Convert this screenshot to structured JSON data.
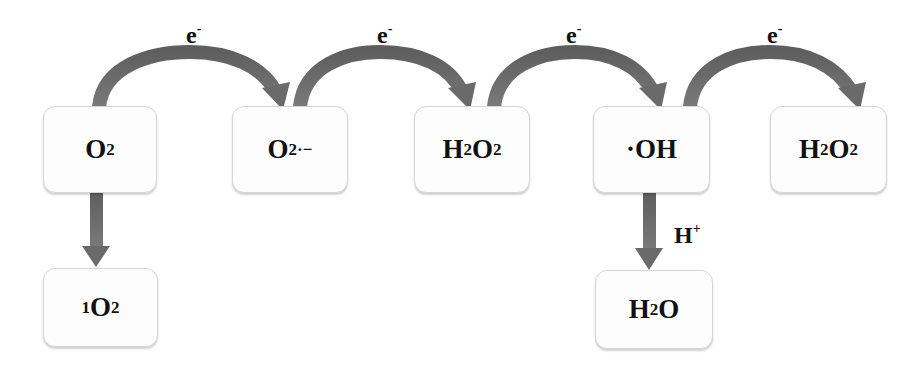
{
  "diagram": {
    "title": "",
    "arrow_color": "#686868",
    "box_border_color": "#d6d6d6",
    "nodes": {
      "o2": {
        "main": "O",
        "sub": "2",
        "sup": ""
      },
      "superoxide": {
        "main": "O",
        "sub": "2",
        "sup": "·−"
      },
      "h2o2_a": {
        "h1": "H",
        "s1": "2",
        "o": "O",
        "s2": "2"
      },
      "hydroxyl": {
        "main": "·OH"
      },
      "h2o2_b": {
        "h1": "H",
        "s1": "2",
        "o": "O",
        "s2": "2"
      },
      "singlet_o2": {
        "pre": "1",
        "main": "O",
        "sub": "2"
      },
      "water": {
        "h": "H",
        "sub": "2",
        "o": "O"
      }
    },
    "edges": [
      {
        "from": "O2",
        "to": "O2·−",
        "label_main": "e",
        "label_sup": "-"
      },
      {
        "from": "O2·−",
        "to": "H2O2",
        "label_main": "e",
        "label_sup": "-"
      },
      {
        "from": "H2O2",
        "to": "·OH",
        "label_main": "e",
        "label_sup": "-"
      },
      {
        "from": "·OH",
        "to": "H2O2",
        "label_main": "e",
        "label_sup": "-"
      },
      {
        "from": "O2",
        "to": "1O2",
        "label_main": "",
        "label_sup": ""
      },
      {
        "from": "·OH",
        "to": "H2O",
        "label_main": "H",
        "label_sup": "+"
      }
    ]
  }
}
